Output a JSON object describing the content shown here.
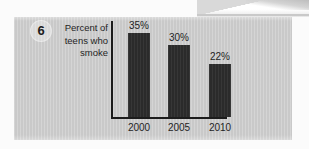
{
  "question": {
    "number": "6"
  },
  "axis_label": {
    "line1": "Percent of",
    "line2": "teens who",
    "line3": "smoke"
  },
  "chart_data": {
    "type": "bar",
    "title": "",
    "subtitle": "",
    "xlabel": "",
    "ylabel": "Percent of teens who smoke",
    "categories": [
      "2000",
      "2005",
      "2010"
    ],
    "values": [
      35,
      30,
      22
    ],
    "value_labels": [
      "35%",
      "30%",
      "22%"
    ],
    "ylim": [
      0,
      40
    ],
    "grid": false,
    "legend": false,
    "bar_color": "#2b2b2b",
    "axis_color": "#1c1c1c"
  },
  "colors": {
    "panel_background": "#c9c9c9",
    "page_background": "#fbfbfb",
    "bar": "#2b2b2b",
    "text": "#1f1f1f"
  }
}
